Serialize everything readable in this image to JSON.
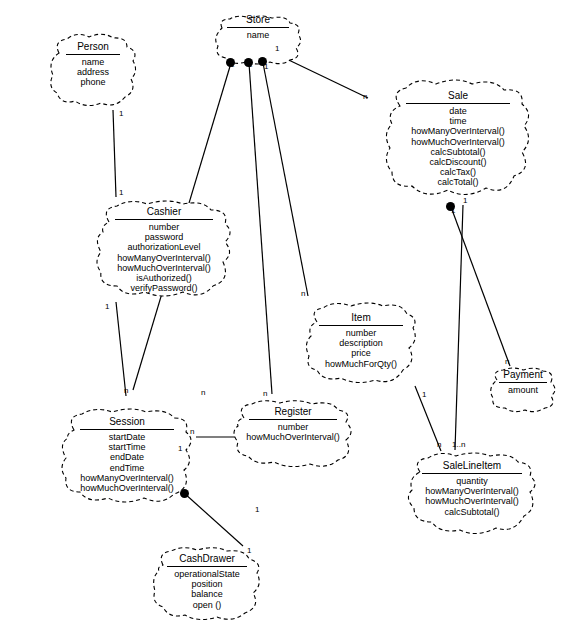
{
  "diagram": {
    "notation": "UML class diagram with cloud-shaped (dashed) class boundaries",
    "stroke_color": "#000000",
    "background_color": "#ffffff"
  },
  "classes": [
    {
      "id": "store",
      "name": "Store",
      "attributes": [
        "name"
      ],
      "operations": [],
      "x": 212,
      "y": 14,
      "w": 92,
      "h": 52
    },
    {
      "id": "person",
      "name": "Person",
      "attributes": [
        "name",
        "address",
        "phone"
      ],
      "operations": [],
      "x": 47,
      "y": 31,
      "w": 92,
      "h": 78
    },
    {
      "id": "sale",
      "name": "Sale",
      "attributes": [
        "date",
        "time"
      ],
      "operations": [
        "howManyOverInterval()",
        "howMuchOverInterval()",
        "calcSubtotal()",
        "calcDiscount()",
        "calcTax()",
        "calcTotal()"
      ],
      "x": 382,
      "y": 76,
      "w": 152,
      "h": 124
    },
    {
      "id": "cashier",
      "name": "Cashier",
      "attributes": [
        "number",
        "password",
        "authorizationLevel"
      ],
      "operations": [
        "howManyOverInterval()",
        "howMuchOverInterval()",
        "isAuthorized()",
        "verifyPassword()"
      ],
      "x": 93,
      "y": 198,
      "w": 142,
      "h": 102
    },
    {
      "id": "item",
      "name": "Item",
      "attributes": [
        "number",
        "description",
        "price"
      ],
      "operations": [
        "howMuchForQty()"
      ],
      "x": 303,
      "y": 300,
      "w": 116,
      "h": 86
    },
    {
      "id": "payment",
      "name": "Payment",
      "attributes": [
        "amount"
      ],
      "operations": [],
      "x": 487,
      "y": 366,
      "w": 72,
      "h": 48
    },
    {
      "id": "session",
      "name": "Session",
      "attributes": [
        "startDate",
        "startTime",
        "endDate",
        "endTime"
      ],
      "operations": [
        "howManyOverInterval()",
        "howMuchOverInterval()"
      ],
      "x": 58,
      "y": 406,
      "w": 138,
      "h": 100
    },
    {
      "id": "register",
      "name": "Register",
      "attributes": [
        "number"
      ],
      "operations": [
        "howMuchOverInterval()"
      ],
      "x": 230,
      "y": 398,
      "w": 126,
      "h": 72
    },
    {
      "id": "salelineitem",
      "name": "SaleLineItem",
      "attributes": [
        "quantity"
      ],
      "operations": [
        "howManyOverInterval()",
        "howMuchOverInterval()",
        "calcSubtotal()"
      ],
      "x": 404,
      "y": 450,
      "w": 136,
      "h": 88
    },
    {
      "id": "cashdrawer",
      "name": "CashDrawer",
      "attributes": [
        "operationalState",
        "position",
        "balance"
      ],
      "operations": [
        "open ()"
      ],
      "x": 151,
      "y": 545,
      "w": 112,
      "h": 78
    }
  ],
  "associations": [
    {
      "from": "person",
      "to": "cashier",
      "from_mult": "1",
      "to_mult": "1",
      "composition": false
    },
    {
      "from": "store",
      "to": "cashier",
      "from_mult": "1",
      "to_mult": "n",
      "composition": true
    },
    {
      "from": "store",
      "to": "register",
      "from_mult": "1",
      "to_mult": "n",
      "composition": true
    },
    {
      "from": "store",
      "to": "item",
      "from_mult": "1",
      "to_mult": "n",
      "composition": true
    },
    {
      "from": "store",
      "to": "sale",
      "from_mult": "1",
      "to_mult": "n",
      "composition": false
    },
    {
      "from": "cashier",
      "to": "session",
      "from_mult": "1",
      "to_mult": "n",
      "composition": false
    },
    {
      "from": "session",
      "to": "register",
      "from_mult": "1",
      "to_mult": "n",
      "composition": false
    },
    {
      "from": "session",
      "to": "cashdrawer",
      "from_mult": "1",
      "to_mult": "1",
      "composition": true
    },
    {
      "from": "sale",
      "to": "payment",
      "from_mult": "1",
      "to_mult": "n",
      "composition": true
    },
    {
      "from": "sale",
      "to": "salelineitem",
      "from_mult": "1",
      "to_mult": "1..n",
      "composition": false
    },
    {
      "from": "item",
      "to": "salelineitem",
      "from_mult": "1",
      "to_mult": "n",
      "composition": false
    }
  ],
  "multiplicity_labels": [
    {
      "text": "1",
      "x": 119,
      "y": 109
    },
    {
      "text": "1",
      "x": 119,
      "y": 188
    },
    {
      "text": "1",
      "x": 230,
      "y": 60
    },
    {
      "text": "1",
      "x": 248,
      "y": 60
    },
    {
      "text": "1",
      "x": 264,
      "y": 62
    },
    {
      "text": "1",
      "x": 275,
      "y": 44
    },
    {
      "text": "n",
      "x": 363,
      "y": 92
    },
    {
      "text": "n",
      "x": 124,
      "y": 386
    },
    {
      "text": "1",
      "x": 105,
      "y": 302
    },
    {
      "text": "n",
      "x": 201,
      "y": 388
    },
    {
      "text": "n",
      "x": 263,
      "y": 389
    },
    {
      "text": "n",
      "x": 301,
      "y": 289
    },
    {
      "text": "n",
      "x": 190,
      "y": 427
    },
    {
      "text": "1",
      "x": 255,
      "y": 505
    },
    {
      "text": "1",
      "x": 451,
      "y": 206
    },
    {
      "text": "1",
      "x": 463,
      "y": 196
    },
    {
      "text": "n",
      "x": 505,
      "y": 357
    },
    {
      "text": "n",
      "x": 437,
      "y": 440
    },
    {
      "text": "1..n",
      "x": 452,
      "y": 440
    },
    {
      "text": "1",
      "x": 422,
      "y": 390
    },
    {
      "text": "1",
      "x": 247,
      "y": 546
    },
    {
      "text": "1",
      "x": 178,
      "y": 444
    }
  ]
}
